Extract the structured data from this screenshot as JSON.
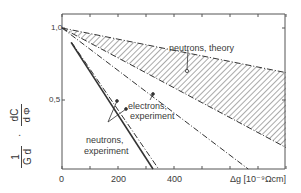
{
  "chart_data": {
    "type": "line",
    "title": "",
    "xlabel": "Δg [10⁻⁹ Ωcm]",
    "ylabel": "1/G_d · dC/dΦ",
    "ylabel_parts": {
      "numerator_left": "1",
      "denominator_left": "G d",
      "numerator_right": "dC",
      "denominator_right": "d Φ"
    },
    "xlim": [
      0,
      800
    ],
    "ylim": [
      0,
      1.1
    ],
    "x_ticks": [
      0,
      100,
      200,
      300,
      400,
      500,
      600,
      700,
      800
    ],
    "x_tick_labels": [
      "0",
      "200",
      "400"
    ],
    "y_tick_labels": [
      "1,0",
      "0,5"
    ],
    "grid": false,
    "series": [
      {
        "name": "neutrons, theory (upper bound)",
        "style": "dash-dot",
        "x": [
          0,
          800
        ],
        "y": [
          1.0,
          0.69
        ]
      },
      {
        "name": "neutrons, theory (lower bound)",
        "style": "dash-dot",
        "x": [
          0,
          800
        ],
        "y": [
          1.0,
          0.17
        ]
      },
      {
        "name": "electrons, experiment",
        "style": "dash-dot",
        "x": [
          0,
          665
        ],
        "y": [
          1.0,
          0.0
        ]
      },
      {
        "name": "neutrons, experiment (1)",
        "style": "solid",
        "x": [
          0,
          325
        ],
        "y": [
          1.0,
          0.0
        ]
      },
      {
        "name": "neutrons, experiment (2)",
        "style": "dash-dot",
        "x": [
          0,
          345
        ],
        "y": [
          1.0,
          0.0
        ]
      }
    ],
    "shaded_region": {
      "name": "neutrons, theory",
      "between": [
        "neutrons, theory (upper bound)",
        "neutrons, theory (lower bound)"
      ],
      "pattern": "hatched"
    },
    "annotations": [
      {
        "text": "neutrons, theory",
        "points_to": "hatched band"
      },
      {
        "text": "electrons, experiment",
        "points_to": "electrons line"
      },
      {
        "text": "neutrons, experiment",
        "points_to": "two neutron experiment lines"
      }
    ]
  },
  "labels": {
    "theory": "neutrons, theory",
    "electrons_1": "electrons,",
    "electrons_2": "experiment",
    "neutrons_1": "neutrons,",
    "neutrons_2": "experiment",
    "y_10": "1,0",
    "y_05": "0,5",
    "x_0": "0",
    "x_200": "200",
    "x_400": "400",
    "x_axis": "Δg [10⁻⁹Ωcm]",
    "ylab_1": "1",
    "ylab_gd": "G d",
    "ylab_dot": "·",
    "ylab_dc": "dC",
    "ylab_dphi": "d Φ"
  }
}
